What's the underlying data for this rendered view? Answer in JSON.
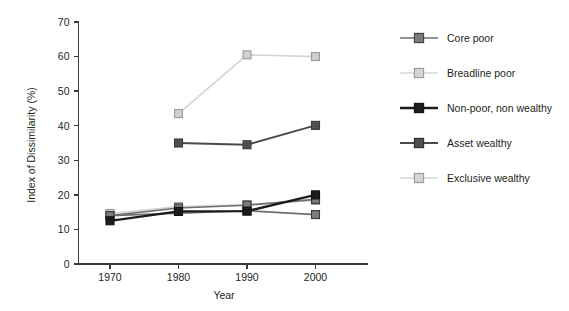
{
  "chart_data": {
    "type": "line",
    "title": "",
    "xlabel": "Year",
    "ylabel": "Index of Dissimilarity (%)",
    "x": [
      1970,
      1980,
      1990,
      2000
    ],
    "xtick_labels": [
      "1970",
      "1980",
      "1990",
      "2000"
    ],
    "ytick_labels": [
      "0",
      "10",
      "20",
      "30",
      "40",
      "50",
      "60",
      "70"
    ],
    "ylim": [
      0,
      70
    ],
    "xlim": [
      1963,
      2005
    ],
    "ystep": 10,
    "grid": false,
    "legend_position": "right",
    "series": [
      {
        "name": "Core poor",
        "color": "#7c7c7c",
        "line_color": "#6e6e6e",
        "x": [
          1970,
          1980,
          1990,
          2000
        ],
        "values": [
          14.0,
          16.2,
          17.0,
          18.7
        ]
      },
      {
        "name": "Breadline poor",
        "color": "#cfcfcf",
        "line_color": "#d6d6d6",
        "x": [
          1970,
          1980,
          1990,
          2000
        ],
        "values": [
          14.6,
          16.6,
          17.2,
          18.4
        ]
      },
      {
        "name": "Non-poor, non wealthy",
        "color": "#1c1c1c",
        "line_color": "#1c1c1c",
        "x": [
          1970,
          1980,
          1990,
          2000
        ],
        "values": [
          12.5,
          15.2,
          15.3,
          20.0
        ]
      },
      {
        "name": "Asset wealthy",
        "color": "#4f4f4f",
        "line_color": "#4a4a4a",
        "x": [
          1980,
          1990,
          2000
        ],
        "values": [
          35.0,
          34.5,
          40.1
        ]
      },
      {
        "name": "Exclusive wealthy",
        "color": "#cfcfcf",
        "line_color": "#d4d4d4",
        "x": [
          1980,
          1990,
          2000
        ],
        "values": [
          43.5,
          60.5,
          60.0
        ]
      },
      {
        "name": "Core poor lower trend",
        "color": "#7c7c7c",
        "line_color": "#6e6e6e",
        "x": [
          1970,
          1990,
          2000
        ],
        "values": [
          14.0,
          15.4,
          14.3
        ],
        "hidden_from_legend": true
      }
    ],
    "legend_entries": [
      {
        "label": "Core poor",
        "marker_fill": "#7c7c7c",
        "marker_stroke": "#3f3f3f",
        "line_color": "#6e6e6e",
        "line_width": 1.7
      },
      {
        "label": "Breadline poor",
        "marker_fill": "#d4d4d4",
        "marker_stroke": "#9a9a9a",
        "line_color": "#d8d8d8",
        "line_width": 1.5
      },
      {
        "label": "Non-poor, non wealthy",
        "marker_fill": "#1c1c1c",
        "marker_stroke": "#111111",
        "line_color": "#1c1c1c",
        "line_width": 2.4
      },
      {
        "label": "Asset wealthy",
        "marker_fill": "#4f4f4f",
        "marker_stroke": "#2b2b2b",
        "line_color": "#4a4a4a",
        "line_width": 2.0
      },
      {
        "label": "Exclusive wealthy",
        "marker_fill": "#d4d4d4",
        "marker_stroke": "#9a9a9a",
        "line_color": "#d8d8d8",
        "line_width": 1.5
      }
    ]
  },
  "colors": {
    "background": "#ffffff",
    "axis": "#3b3b3b",
    "text": "#231f20"
  }
}
